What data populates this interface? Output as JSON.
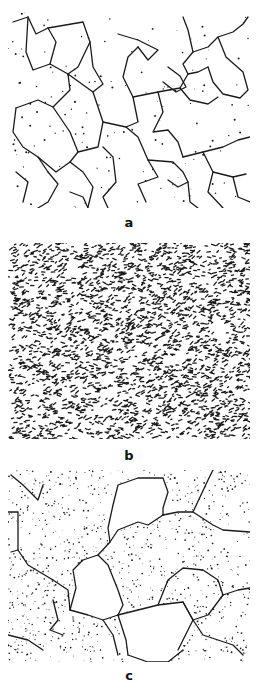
{
  "figure": {
    "panels": [
      {
        "id": "a",
        "label": "a",
        "description": "coarse ferrite grains with thin grain boundaries and sparse dots",
        "ink": "#1a1a1a",
        "top": 12,
        "height": 196,
        "label_top": 216,
        "boundaries": [
          [
            [
              5,
              10
            ],
            [
              20,
              5
            ],
            [
              28,
              22
            ],
            [
              40,
              16
            ]
          ],
          [
            [
              20,
              5
            ],
            [
              18,
              40
            ],
            [
              25,
              58
            ],
            [
              42,
              52
            ],
            [
              48,
              30
            ],
            [
              40,
              16
            ]
          ],
          [
            [
              40,
              16
            ],
            [
              75,
              10
            ],
            [
              82,
              30
            ],
            [
              70,
              55
            ],
            [
              60,
              62
            ]
          ],
          [
            [
              42,
              52
            ],
            [
              60,
              62
            ],
            [
              62,
              78
            ],
            [
              45,
              95
            ],
            [
              30,
              88
            ],
            [
              8,
              96
            ]
          ],
          [
            [
              60,
              62
            ],
            [
              85,
              80
            ],
            [
              95,
              72
            ],
            [
              85,
              55
            ],
            [
              82,
              30
            ]
          ],
          [
            [
              85,
              80
            ],
            [
              95,
              110
            ],
            [
              90,
              135
            ],
            [
              70,
              140
            ],
            [
              62,
              120
            ],
            [
              45,
              95
            ]
          ],
          [
            [
              95,
              110
            ],
            [
              118,
              115
            ],
            [
              130,
              110
            ],
            [
              125,
              85
            ],
            [
              115,
              65
            ],
            [
              120,
              45
            ],
            [
              130,
              35
            ]
          ],
          [
            [
              110,
              22
            ],
            [
              130,
              28
            ],
            [
              150,
              38
            ],
            [
              140,
              48
            ],
            [
              130,
              35
            ]
          ],
          [
            [
              125,
              85
            ],
            [
              150,
              80
            ],
            [
              172,
              76
            ],
            [
              180,
              62
            ],
            [
              175,
              52
            ],
            [
              185,
              40
            ],
            [
              180,
              18
            ],
            [
              175,
              5
            ]
          ],
          [
            [
              150,
              80
            ],
            [
              155,
              100
            ],
            [
              145,
              120
            ],
            [
              160,
              118
            ],
            [
              170,
              130
            ],
            [
              175,
              145
            ]
          ],
          [
            [
              160,
              55
            ],
            [
              172,
              64
            ],
            [
              178,
              75
            ],
            [
              168,
              80
            ],
            [
              155,
              70
            ]
          ],
          [
            [
              185,
              40
            ],
            [
              200,
              35
            ],
            [
              210,
              25
            ],
            [
              225,
              20
            ],
            [
              235,
              12
            ],
            [
              240,
              5
            ]
          ],
          [
            [
              210,
              25
            ],
            [
              218,
              45
            ],
            [
              235,
              60
            ],
            [
              240,
              78
            ],
            [
              232,
              86
            ],
            [
              215,
              82
            ],
            [
              205,
              70
            ],
            [
              200,
              55
            ]
          ],
          [
            [
              200,
              55
            ],
            [
              190,
              60
            ],
            [
              180,
              62
            ]
          ],
          [
            [
              172,
              76
            ],
            [
              182,
              88
            ],
            [
              200,
              92
            ],
            [
              210,
              85
            ]
          ],
          [
            [
              8,
              96
            ],
            [
              5,
              120
            ],
            [
              15,
              135
            ],
            [
              30,
              145
            ],
            [
              40,
              160
            ]
          ],
          [
            [
              30,
              145
            ],
            [
              48,
              160
            ],
            [
              62,
              150
            ],
            [
              70,
              140
            ]
          ],
          [
            [
              62,
              150
            ],
            [
              75,
              160
            ],
            [
              85,
              175
            ],
            [
              80,
              195
            ]
          ],
          [
            [
              95,
              135
            ],
            [
              105,
              145
            ],
            [
              108,
              170
            ],
            [
              95,
              185
            ],
            [
              100,
              196
            ]
          ],
          [
            [
              118,
              115
            ],
            [
              130,
              125
            ],
            [
              140,
              148
            ],
            [
              150,
              165
            ],
            [
              130,
              172
            ],
            [
              138,
              190
            ]
          ],
          [
            [
              140,
              148
            ],
            [
              165,
              150
            ],
            [
              175,
              160
            ],
            [
              180,
              170
            ],
            [
              170,
              175
            ],
            [
              160,
              168
            ]
          ],
          [
            [
              175,
              145
            ],
            [
              195,
              140
            ],
            [
              215,
              135
            ],
            [
              230,
              128
            ],
            [
              242,
              125
            ]
          ],
          [
            [
              195,
              140
            ],
            [
              205,
              160
            ],
            [
              225,
              165
            ],
            [
              238,
              162
            ]
          ],
          [
            [
              205,
              160
            ],
            [
              200,
              180
            ],
            [
              215,
              196
            ]
          ],
          [
            [
              8,
              160
            ],
            [
              20,
              170
            ],
            [
              15,
              190
            ]
          ],
          [
            [
              40,
              160
            ],
            [
              50,
              172
            ],
            [
              40,
              190
            ],
            [
              30,
              196
            ]
          ],
          [
            [
              62,
              180
            ],
            [
              75,
              185
            ],
            [
              80,
              196
            ]
          ],
          [
            [
              180,
              170
            ],
            [
              182,
              190
            ],
            [
              190,
              196
            ]
          ],
          [
            [
              225,
              165
            ],
            [
              230,
              185
            ],
            [
              242,
              190
            ]
          ]
        ],
        "dots": {
          "count": 140,
          "seed": 11,
          "r": 0.7
        }
      },
      {
        "id": "b",
        "label": "b",
        "description": "fine dense speckled microstructure, uniformly distributed dark particles",
        "ink": "#1a1a1a",
        "top": 243,
        "height": 196,
        "label_top": 449,
        "speckle": {
          "count": 2600,
          "seed": 7,
          "min_len": 1.2,
          "max_len": 4.2,
          "width": 1.3
        }
      },
      {
        "id": "c",
        "label": "c",
        "description": "coarse grains with large clean polygonal grains and dotted fine-particle regions",
        "ink": "#1a1a1a",
        "top": 470,
        "height": 192,
        "label_top": 669,
        "boundaries": [
          [
            [
              3,
              5
            ],
            [
              15,
              15
            ],
            [
              30,
              30
            ],
            [
              35,
              15
            ]
          ],
          [
            [
              0,
              42
            ],
            [
              10,
              42
            ],
            [
              10,
              80
            ],
            [
              3,
              82
            ]
          ],
          [
            [
              10,
              80
            ],
            [
              20,
              95
            ],
            [
              45,
              110
            ],
            [
              60,
              120
            ],
            [
              62,
              140
            ]
          ],
          [
            [
              62,
              140
            ],
            [
              80,
              145
            ],
            [
              95,
              150
            ],
            [
              110,
              145
            ]
          ],
          [
            [
              62,
              140
            ],
            [
              68,
              118
            ],
            [
              65,
              100
            ],
            [
              75,
              90
            ],
            [
              90,
              85
            ],
            [
              100,
              95
            ],
            [
              110,
              120
            ],
            [
              115,
              135
            ],
            [
              110,
              145
            ]
          ],
          [
            [
              90,
              85
            ],
            [
              102,
              72
            ],
            [
              110,
              60
            ],
            [
              130,
              52
            ],
            [
              140,
              55
            ],
            [
              155,
              45
            ]
          ],
          [
            [
              110,
              145
            ],
            [
              130,
              140
            ],
            [
              150,
              135
            ],
            [
              175,
              132
            ],
            [
              185,
              150
            ],
            [
              175,
              170
            ],
            [
              170,
              180
            ]
          ],
          [
            [
              110,
              145
            ],
            [
              118,
              170
            ],
            [
              120,
              185
            ]
          ],
          [
            [
              120,
              185
            ],
            [
              140,
              192
            ],
            [
              160,
              192
            ],
            [
              175,
              180
            ]
          ],
          [
            [
              102,
              72
            ],
            [
              100,
              58
            ],
            [
              105,
              35
            ],
            [
              110,
              15
            ],
            [
              130,
              8
            ],
            [
              155,
              8
            ],
            [
              160,
              22
            ],
            [
              155,
              38
            ],
            [
              155,
              45
            ]
          ],
          [
            [
              155,
              45
            ],
            [
              170,
              42
            ],
            [
              185,
              42
            ],
            [
              200,
              10
            ],
            [
              205,
              0
            ]
          ],
          [
            [
              185,
              42
            ],
            [
              205,
              55
            ],
            [
              215,
              60
            ],
            [
              242,
              62
            ]
          ],
          [
            [
              150,
              135
            ],
            [
              160,
              110
            ],
            [
              175,
              98
            ],
            [
              195,
              100
            ],
            [
              210,
              110
            ],
            [
              215,
              125
            ],
            [
              230,
              120
            ],
            [
              242,
              118
            ]
          ],
          [
            [
              175,
              132
            ],
            [
              185,
              150
            ],
            [
              200,
              145
            ],
            [
              215,
              125
            ]
          ],
          [
            [
              185,
              150
            ],
            [
              195,
              165
            ],
            [
              210,
              170
            ],
            [
              225,
              175
            ],
            [
              235,
              185
            ]
          ],
          [
            [
              45,
              130
            ],
            [
              50,
              150
            ],
            [
              42,
              160
            ],
            [
              55,
              165
            ]
          ],
          [
            [
              0,
              165
            ],
            [
              20,
              170
            ],
            [
              35,
              180
            ]
          ],
          [
            [
              95,
              150
            ],
            [
              105,
              165
            ],
            [
              110,
              185
            ]
          ]
        ],
        "dots": {
          "count": 900,
          "seed": 23,
          "r": 0.6
        },
        "clear_regions": [
          [
            [
              68,
              118
            ],
            [
              65,
              100
            ],
            [
              75,
              90
            ],
            [
              90,
              85
            ],
            [
              100,
              95
            ],
            [
              110,
              120
            ],
            [
              115,
              135
            ],
            [
              110,
              145
            ],
            [
              95,
              150
            ],
            [
              80,
              145
            ],
            [
              62,
              140
            ]
          ],
          [
            [
              110,
              145
            ],
            [
              130,
              140
            ],
            [
              150,
              135
            ],
            [
              175,
              132
            ],
            [
              185,
              150
            ],
            [
              175,
              170
            ],
            [
              175,
              180
            ],
            [
              160,
              192
            ],
            [
              140,
              192
            ],
            [
              120,
              185
            ],
            [
              118,
              170
            ]
          ],
          [
            [
              110,
              15
            ],
            [
              130,
              8
            ],
            [
              155,
              8
            ],
            [
              160,
              22
            ],
            [
              155,
              38
            ],
            [
              155,
              45
            ],
            [
              140,
              55
            ],
            [
              130,
              52
            ],
            [
              110,
              60
            ],
            [
              102,
              60
            ],
            [
              105,
              35
            ]
          ]
        ]
      }
    ]
  }
}
